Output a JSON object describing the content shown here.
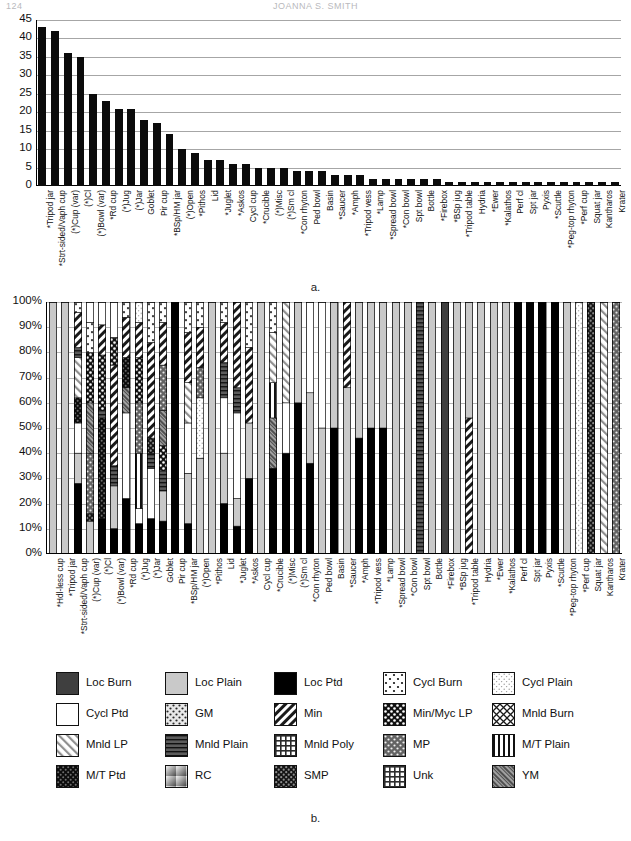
{
  "page": {
    "folio": "124",
    "running_head": "JOANNA S. SMITH",
    "caption_a": "a.",
    "caption_b": "b."
  },
  "chart_data": [
    {
      "id": "a",
      "type": "bar",
      "title": "",
      "xlabel": "",
      "ylabel": "",
      "ylim": [
        0,
        45
      ],
      "yticks": [
        "0",
        "5",
        "10",
        "15",
        "20",
        "25",
        "30",
        "35",
        "40",
        "45"
      ],
      "grid": true,
      "legend_position": "none",
      "bar_color": "#0b0b0b",
      "categories": [
        "*Tripod jar",
        "*Strt-sided/Vaph cup",
        "(*)Cup (var)",
        "(*)Cl",
        "(*)Bowl (var)",
        "*Rd cup",
        "(*)Jug",
        "(*)Jar",
        "Goblet",
        "Pir cup",
        "*BSp/HM jar",
        "(*)Open",
        "*Pithos",
        "Lid",
        "*Juglet",
        "*Askos",
        "Cycl cup",
        "*Crucible",
        "(*)Misc",
        "(*)Sm cl",
        "*Con rhyton",
        "Ped bowl",
        "Basin",
        "*Saucer",
        "*Amph",
        "*Tripod vess",
        "*Lamp",
        "*Spread bowl",
        "*Con bowl",
        "Spt bowl",
        "Bottle",
        "*Firebox",
        "*BSp jug",
        "*Tripod table",
        "Hydria",
        "*Ewer",
        "*Kalathos",
        "Perf cl",
        "Spt jar",
        "Pyxis",
        "*Scuttle",
        "*Peg-top rhyton",
        "*Perf cup",
        "Squat jar",
        "Kantharos",
        "Krater"
      ],
      "values": [
        43,
        42,
        36,
        35,
        25,
        23,
        21,
        21,
        18,
        17,
        14,
        10,
        9,
        7,
        7,
        6,
        6,
        5,
        5,
        5,
        4,
        4,
        4,
        3,
        3,
        3,
        2,
        2,
        2,
        2,
        2,
        2,
        1,
        1,
        1,
        1,
        1,
        1,
        1,
        1,
        1,
        1,
        1,
        1,
        1,
        1
      ]
    },
    {
      "id": "b",
      "type": "bar",
      "stacked": true,
      "normalized": true,
      "title": "",
      "xlabel": "",
      "ylabel": "",
      "ylim": [
        0,
        100
      ],
      "yticks": [
        "0%",
        "10%",
        "20%",
        "30%",
        "40%",
        "50%",
        "60%",
        "70%",
        "80%",
        "90%",
        "100%"
      ],
      "grid": true,
      "legend_position": "below",
      "categories": [
        "*Hdl-less cup",
        "*Tripod jar",
        "*Strt-sided/Vaph cup",
        "(*)Cup (var)",
        "(*)Cl",
        "(*)Bowl (var)",
        "*Rd cup",
        "(*)Jug",
        "(*)Jar",
        "Goblet",
        "Pir cup",
        "*BSp/HM jar",
        "(*)Open",
        "*Pithos",
        "Lid",
        "*Juglet",
        "*Askos",
        "Cycl cup",
        "*Crucible",
        "(*)Misc",
        "(*)Sm cl",
        "*Con rhyton",
        "Ped bowl",
        "Basin",
        "*Saucer",
        "*Amph",
        "*Tripod vess",
        "*Lamp",
        "*Spread bowl",
        "*Con bowl",
        "Spt bowl",
        "Bottle",
        "*Firebox",
        "*BSp jug",
        "*Tripod table",
        "Hydria",
        "*Ewer",
        "*Kalathos",
        "Perf cl",
        "Spt jar",
        "Pyxis",
        "*Scuttle",
        "*Peg-top rhyton",
        "*Perf cup",
        "Squat jar",
        "Kantharos",
        "Krater"
      ],
      "series_keys": [
        "loc_burn",
        "loc_plain",
        "loc_ptd",
        "cycl_burn",
        "cycl_plain",
        "cycl_ptd",
        "gm",
        "min",
        "min_myc_lp",
        "mnld_burn",
        "mnld_lp",
        "mnld_plain",
        "mnld_poly",
        "mp",
        "mt_plain",
        "mt_ptd",
        "rc",
        "smp",
        "unk",
        "ym"
      ],
      "stacks": [
        [
          [
            "loc_plain",
            100
          ]
        ],
        [
          [
            "loc_plain",
            100
          ]
        ],
        [
          [
            "loc_ptd",
            28
          ],
          [
            "loc_plain",
            12
          ],
          [
            "cycl_ptd",
            12
          ],
          [
            "mt_ptd",
            10
          ],
          [
            "mnld_lp",
            16
          ],
          [
            "mnld_plain",
            4
          ],
          [
            "min",
            14
          ],
          [
            "cycl_burn",
            4
          ]
        ],
        [
          [
            "loc_plain",
            13
          ],
          [
            "smp",
            3
          ],
          [
            "mp",
            24
          ],
          [
            "ym",
            20
          ],
          [
            "min_myc_lp",
            20
          ],
          [
            "cycl_burn",
            12
          ],
          [
            "cycl_ptd",
            8
          ]
        ],
        [
          [
            "loc_ptd",
            14
          ],
          [
            "mt_ptd",
            40
          ],
          [
            "mnld_plain",
            3
          ],
          [
            "min_myc_lp",
            22
          ],
          [
            "min",
            12
          ],
          [
            "cycl_ptd",
            9
          ]
        ],
        [
          [
            "loc_ptd",
            10
          ],
          [
            "loc_plain",
            17
          ],
          [
            "mnld_plain",
            8
          ],
          [
            "min",
            40
          ],
          [
            "min_myc_lp",
            11
          ],
          [
            "cycl_ptd",
            14
          ]
        ],
        [
          [
            "loc_ptd",
            22
          ],
          [
            "cycl_ptd",
            34
          ],
          [
            "ym",
            10
          ],
          [
            "mt_ptd",
            12
          ],
          [
            "min",
            16
          ],
          [
            "cycl_burn",
            6
          ]
        ],
        [
          [
            "loc_ptd",
            12
          ],
          [
            "cycl_ptd",
            6
          ],
          [
            "mt_plain",
            22
          ],
          [
            "mp",
            20
          ],
          [
            "min_myc_lp",
            18
          ],
          [
            "min",
            14
          ],
          [
            "cycl_plain",
            8
          ]
        ],
        [
          [
            "loc_ptd",
            14
          ],
          [
            "cycl_ptd",
            20
          ],
          [
            "mnld_plain",
            6
          ],
          [
            "smp",
            6
          ],
          [
            "min",
            38
          ],
          [
            "cycl_burn",
            16
          ]
        ],
        [
          [
            "loc_ptd",
            13
          ],
          [
            "loc_plain",
            12
          ],
          [
            "mnld_plain",
            8
          ],
          [
            "min_myc_lp",
            10
          ],
          [
            "ym",
            14
          ],
          [
            "mp",
            18
          ],
          [
            "min",
            17
          ],
          [
            "cycl_burn",
            8
          ]
        ],
        [
          [
            "loc_ptd",
            100
          ]
        ],
        [
          [
            "loc_ptd",
            12
          ],
          [
            "loc_plain",
            20
          ],
          [
            "cycl_ptd",
            20
          ],
          [
            "mnld_lp",
            16
          ],
          [
            "min",
            20
          ],
          [
            "cycl_burn",
            12
          ]
        ],
        [
          [
            "loc_plain",
            38
          ],
          [
            "cycl_plain",
            24
          ],
          [
            "mp",
            12
          ],
          [
            "min",
            16
          ],
          [
            "cycl_burn",
            10
          ]
        ],
        [
          [
            "loc_plain",
            100
          ]
        ],
        [
          [
            "loc_ptd",
            20
          ],
          [
            "loc_plain",
            20
          ],
          [
            "cycl_ptd",
            22
          ],
          [
            "mnld_plain",
            14
          ],
          [
            "min",
            16
          ],
          [
            "cycl_burn",
            8
          ]
        ],
        [
          [
            "loc_ptd",
            11
          ],
          [
            "loc_plain",
            11
          ],
          [
            "cycl_ptd",
            34
          ],
          [
            "mnld_plain",
            10
          ],
          [
            "min",
            34
          ]
        ],
        [
          [
            "loc_ptd",
            30
          ],
          [
            "loc_plain",
            22
          ],
          [
            "min",
            30
          ],
          [
            "cycl_burn",
            18
          ]
        ],
        [
          [
            "loc_plain",
            100
          ]
        ],
        [
          [
            "loc_ptd",
            34
          ],
          [
            "ym",
            20
          ],
          [
            "mt_plain",
            14
          ],
          [
            "mnld_lp",
            20
          ],
          [
            "cycl_burn",
            12
          ]
        ],
        [
          [
            "loc_ptd",
            40
          ],
          [
            "cycl_ptd",
            20
          ],
          [
            "mnld_lp",
            40
          ]
        ],
        [
          [
            "loc_ptd",
            60
          ],
          [
            "loc_plain",
            40
          ]
        ],
        [
          [
            "loc_ptd",
            36
          ],
          [
            "loc_plain",
            28
          ],
          [
            "cycl_ptd",
            36
          ]
        ],
        [
          [
            "loc_plain",
            50
          ],
          [
            "cycl_ptd",
            50
          ]
        ],
        [
          [
            "loc_ptd",
            50
          ],
          [
            "loc_plain",
            50
          ]
        ],
        [
          [
            "loc_plain",
            66
          ],
          [
            "min",
            34
          ]
        ],
        [
          [
            "loc_ptd",
            46
          ],
          [
            "loc_plain",
            54
          ]
        ],
        [
          [
            "loc_ptd",
            50
          ],
          [
            "loc_plain",
            50
          ]
        ],
        [
          [
            "loc_ptd",
            50
          ],
          [
            "loc_plain",
            50
          ]
        ],
        [
          [
            "loc_plain",
            100
          ]
        ],
        [
          [
            "loc_plain",
            100
          ]
        ],
        [
          [
            "mnld_plain",
            100
          ]
        ],
        [
          [
            "loc_plain",
            100
          ]
        ],
        [
          [
            "loc_burn",
            100
          ]
        ],
        [
          [
            "loc_plain",
            100
          ]
        ],
        [
          [
            "min",
            54
          ],
          [
            "loc_plain",
            46
          ]
        ],
        [
          [
            "loc_plain",
            100
          ]
        ],
        [
          [
            "loc_plain",
            100
          ]
        ],
        [
          [
            "loc_plain",
            100
          ]
        ],
        [
          [
            "loc_ptd",
            100
          ]
        ],
        [
          [
            "loc_ptd",
            100
          ]
        ],
        [
          [
            "loc_ptd",
            100
          ]
        ],
        [
          [
            "loc_ptd",
            100
          ]
        ],
        [
          [
            "loc_plain",
            100
          ]
        ],
        [
          [
            "cycl_plain",
            100
          ]
        ],
        [
          [
            "smp",
            100
          ]
        ],
        [
          [
            "mnld_lp",
            100
          ]
        ],
        [
          [
            "mp",
            100
          ]
        ]
      ]
    }
  ],
  "legend": {
    "items": [
      {
        "key": "loc_burn",
        "label": "Loc Burn"
      },
      {
        "key": "loc_plain",
        "label": "Loc Plain"
      },
      {
        "key": "loc_ptd",
        "label": "Loc Ptd"
      },
      {
        "key": "cycl_burn",
        "label": "Cycl Burn"
      },
      {
        "key": "cycl_plain",
        "label": "Cycl Plain"
      },
      {
        "key": "cycl_ptd",
        "label": "Cycl Ptd"
      },
      {
        "key": "gm",
        "label": "GM"
      },
      {
        "key": "min",
        "label": "Min"
      },
      {
        "key": "min_myc_lp",
        "label": "Min/Myc LP"
      },
      {
        "key": "mnld_burn",
        "label": "Mnld Burn"
      },
      {
        "key": "mnld_lp",
        "label": "Mnld LP"
      },
      {
        "key": "mnld_plain",
        "label": "Mnld Plain"
      },
      {
        "key": "mnld_poly",
        "label": "Mnld Poly"
      },
      {
        "key": "mp",
        "label": "MP"
      },
      {
        "key": "mt_plain",
        "label": "M/T Plain"
      },
      {
        "key": "mt_ptd",
        "label": "M/T Ptd"
      },
      {
        "key": "rc",
        "label": "RC"
      },
      {
        "key": "smp",
        "label": "SMP"
      },
      {
        "key": "unk",
        "label": "Unk"
      },
      {
        "key": "ym",
        "label": "YM"
      }
    ]
  }
}
